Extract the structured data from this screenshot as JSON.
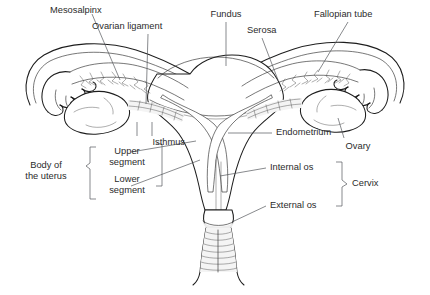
{
  "figure": {
    "caption": "",
    "background_color": "#ffffff",
    "line_color": "#1d1d1d",
    "leader_color": "#55585c",
    "text_color": "#2b2b2b"
  },
  "labels": {
    "mesosalpinx": "Mesosalpinx",
    "ovarian_ligament": "Ovarian ligament",
    "fundus": "Fundus",
    "serosa": "Serosa",
    "fallopian_tube": "Fallopian tube",
    "endometrium": "Endometrium",
    "ovary": "Ovary",
    "isthmus": "Isthmus",
    "upper_segment_line1": "Upper",
    "upper_segment_line2": "segment",
    "lower_segment_line1": "Lower",
    "lower_segment_line2": "segment",
    "body_of_uterus_line1": "Body of",
    "body_of_uterus_line2": "the uterus",
    "internal_os": "Internal os",
    "external_os": "External os",
    "cervix": "Cervix"
  },
  "structures": [
    "fundus",
    "serosa",
    "endometrium",
    "uterine-cavity",
    "fallopian-tube-left",
    "fallopian-tube-right",
    "fimbriae-left",
    "fimbriae-right",
    "ovary-left",
    "ovary-right",
    "mesosalpinx",
    "ovarian-ligament",
    "isthmus",
    "cervix",
    "internal-os",
    "external-os",
    "vagina"
  ]
}
